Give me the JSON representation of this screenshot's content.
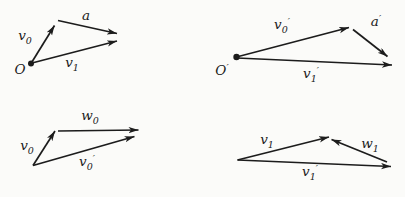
{
  "colors": {
    "ink": "#1c1c1c",
    "background": "#fbfbf9"
  },
  "diagrams": {
    "top_left": {
      "origin": {
        "base": "O",
        "prime": ""
      },
      "v0": {
        "base": "v",
        "sub": "0",
        "prime": ""
      },
      "a": {
        "base": "a",
        "prime": ""
      },
      "v1": {
        "base": "v",
        "sub": "1",
        "prime": ""
      }
    },
    "top_right": {
      "origin": {
        "base": "O",
        "prime": "′"
      },
      "v0": {
        "base": "v",
        "sub": "0",
        "prime": "′"
      },
      "a": {
        "base": "a",
        "prime": "′"
      },
      "v1": {
        "base": "v",
        "sub": "1",
        "prime": "′"
      }
    },
    "bottom_left": {
      "v0": {
        "base": "v",
        "sub": "0",
        "prime": ""
      },
      "w0": {
        "base": "w",
        "sub": "0",
        "prime": ""
      },
      "v0_prime": {
        "base": "v",
        "sub": "0",
        "prime": "′"
      }
    },
    "bottom_right": {
      "v1": {
        "base": "v",
        "sub": "1",
        "prime": ""
      },
      "w1": {
        "base": "w",
        "sub": "1",
        "prime": ""
      },
      "v1_prime": {
        "base": "v",
        "sub": "1",
        "prime": "′"
      }
    }
  }
}
